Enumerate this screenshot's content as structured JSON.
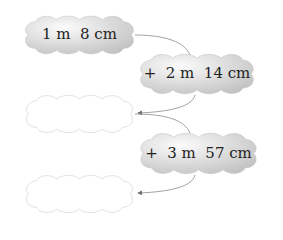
{
  "clouds": [
    {
      "id": "start",
      "text": "1 m  8 cm",
      "filled": true
    },
    {
      "id": "add-1",
      "text": "+  2 m  14 cm",
      "filled": true
    },
    {
      "id": "result-1",
      "text": "",
      "filled": false
    },
    {
      "id": "add-2",
      "text": "+  3 m  57 cm",
      "filled": true
    },
    {
      "id": "result-2",
      "text": "",
      "filled": false
    }
  ],
  "colors": {
    "cloud_fill": "#d6d6d6",
    "cloud_highlight": "#f4f4f4",
    "empty_outline": "#d8d8d8",
    "arrow": "#7a7a7a",
    "text": "#222222"
  }
}
